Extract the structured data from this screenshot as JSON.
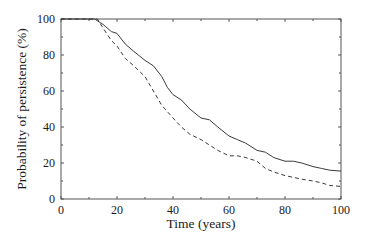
{
  "chart_data": {
    "type": "line",
    "title": "",
    "xlabel": "Time (years)",
    "ylabel": "Probability of persistence (%)",
    "xlim": [
      0,
      100
    ],
    "ylim": [
      0,
      100
    ],
    "xticks": [
      0,
      20,
      40,
      60,
      80,
      100
    ],
    "yticks": [
      0,
      20,
      40,
      60,
      80,
      100
    ],
    "grid": false,
    "legend": null,
    "series": [
      {
        "name": "solid",
        "style": "solid",
        "x": [
          0,
          12,
          15,
          18,
          20,
          23,
          26,
          30,
          33,
          36,
          38,
          40,
          43,
          46,
          50,
          53,
          56,
          60,
          63,
          66,
          70,
          73,
          76,
          80,
          83,
          86,
          90,
          93,
          96,
          100
        ],
        "y": [
          100,
          100,
          97,
          93,
          92,
          86,
          82,
          77,
          74,
          68,
          62,
          58,
          55,
          50,
          45,
          44,
          40,
          35,
          33,
          31,
          27,
          26,
          23,
          21,
          21,
          20,
          18,
          17,
          16,
          15.5
        ]
      },
      {
        "name": "dashed",
        "style": "dashed",
        "x": [
          0,
          13,
          15,
          18,
          20,
          23,
          26,
          30,
          33,
          36,
          40,
          43,
          46,
          50,
          53,
          56,
          60,
          63,
          66,
          70,
          73,
          76,
          80,
          83,
          86,
          90,
          93,
          96,
          100
        ],
        "y": [
          100,
          100,
          95,
          88,
          85,
          78,
          74,
          68,
          60,
          52,
          45,
          40,
          36,
          33,
          30,
          27,
          24,
          24,
          23,
          21,
          17,
          15,
          13,
          12,
          11,
          10,
          9,
          7.5,
          7
        ]
      }
    ]
  },
  "axes": {
    "x_tick_labels": [
      "0",
      "20",
      "40",
      "60",
      "80",
      "100"
    ],
    "y_tick_labels": [
      "0",
      "20",
      "40",
      "60",
      "80",
      "100"
    ],
    "xlabel": "Time (years)",
    "ylabel": "Probability of persistence (%)"
  },
  "colors": {
    "line": "#3a3a3a",
    "axis": "#555555",
    "background": "#ffffff"
  }
}
